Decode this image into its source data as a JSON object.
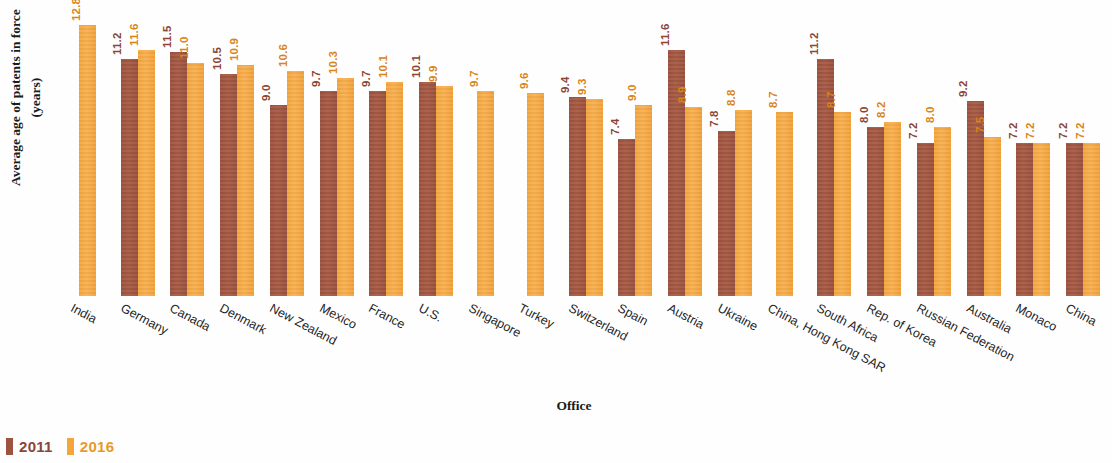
{
  "chart_data": {
    "type": "bar",
    "title": "",
    "xlabel": "Office",
    "ylabel": "Average age of patents in force\n(years)",
    "ylim": [
      0,
      13.5
    ],
    "grid": false,
    "legend_position": "bottom-left",
    "colors": {
      "2011": "#9c5340",
      "2016": "#f4a63c"
    },
    "categories": [
      "India",
      "Germany",
      "Canada",
      "Denmark",
      "New Zealand",
      "Mexico",
      "France",
      "U.S.",
      "Singapore",
      "Turkey",
      "Switzerland",
      "Spain",
      "Austria",
      "Ukraine",
      "China, Hong Kong SAR",
      "South Africa",
      "Rep. of Korea",
      "Russian Federation",
      "Australia",
      "Monaco",
      "China"
    ],
    "series": [
      {
        "name": "2011",
        "values": [
          null,
          11.2,
          11.5,
          10.5,
          9.0,
          9.7,
          9.7,
          10.1,
          null,
          null,
          9.4,
          7.4,
          11.6,
          7.8,
          null,
          11.2,
          8.0,
          7.2,
          9.2,
          7.2,
          7.2
        ],
        "labels": [
          "",
          "11.2",
          "11.5",
          "10.5",
          "9.0",
          "9.7",
          "9.7",
          "10.1",
          "",
          "",
          "9.4",
          "7.4",
          "11.6",
          "7.8",
          "",
          "11.2",
          "8.0",
          "7.2",
          "9.2",
          "7.2",
          "7.2"
        ]
      },
      {
        "name": "2016",
        "values": [
          12.8,
          11.6,
          11.0,
          10.9,
          10.6,
          10.3,
          10.1,
          9.9,
          9.7,
          9.6,
          9.3,
          9.0,
          8.9,
          8.8,
          8.7,
          8.7,
          8.2,
          8.0,
          7.5,
          7.2,
          7.2
        ],
        "labels": [
          "12.8",
          "11.6",
          "11.0",
          "10.9",
          "10.6",
          "10.3",
          "10.1",
          "9.9",
          "9.7",
          "9.6",
          "9.3",
          "9.0",
          "8.9",
          "8.8",
          "8.7",
          "8.7",
          "8.2",
          "8.0",
          "7.5",
          "7.2",
          "7.2"
        ]
      }
    ]
  },
  "legend": {
    "items": [
      {
        "label": "2011",
        "key": "c2011"
      },
      {
        "label": "2016",
        "key": "c2016"
      }
    ]
  },
  "axis": {
    "x_title": "Office",
    "y_title": "Average age of patents in force\n(years)"
  }
}
